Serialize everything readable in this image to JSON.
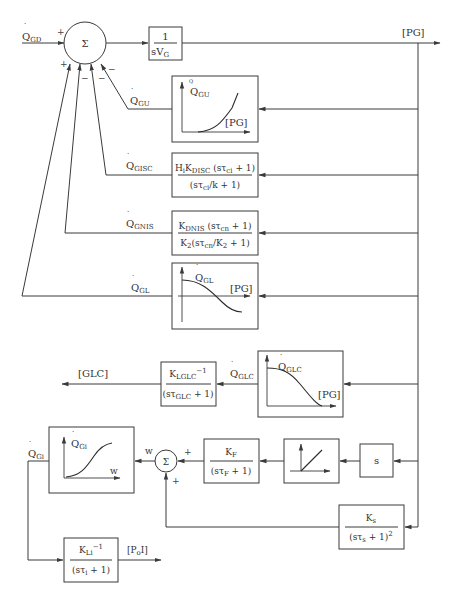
{
  "diagram": {
    "summing_junction_main": {
      "symbol": "Σ",
      "signs": {
        "q_gd": "+",
        "q_gl": "+",
        "q_gnis": "−",
        "q_gisc": "−",
        "q_gu": "−"
      }
    },
    "input": {
      "label_main": "Q",
      "label_sub": "GD",
      "dot": "·"
    },
    "integrator": {
      "numerator": "1",
      "denominator_main": "sV",
      "denominator_sub": "G"
    },
    "output": {
      "label": "[PG]"
    },
    "feedback_blocks": [
      {
        "id": "gu",
        "signal_main": "Q",
        "signal_sub": "GU",
        "type": "curve",
        "curve": "rising",
        "y_label_main": "Q",
        "y_label_sub": "GU",
        "x_label": "[PG]"
      },
      {
        "id": "gisc",
        "signal_main": "Q",
        "signal_sub": "GISC",
        "type": "transfer",
        "numerator": [
          "H",
          "i",
          "K",
          "DISC",
          " (sτ",
          "ci",
          " + 1)"
        ],
        "denominator": [
          "(sτ",
          "ci",
          "/k + 1)"
        ]
      },
      {
        "id": "gnis",
        "signal_main": "Q",
        "signal_sub": "GNIS",
        "type": "transfer",
        "numerator": [
          "K",
          "DNIS",
          " (sτ",
          "cn",
          " + 1)"
        ],
        "denominator": [
          "K",
          "2",
          "(sτ",
          "cn",
          "/K",
          "2",
          " + 1)"
        ]
      },
      {
        "id": "gl",
        "signal_main": "Q",
        "signal_sub": "GL",
        "type": "curve",
        "curve": "falling",
        "y_label_main": "Q",
        "y_label_sub": "GL",
        "x_label": "[PG]"
      }
    ],
    "glc_path": {
      "curve_block": {
        "y_label_main": "Q",
        "y_label_sub": "GLC",
        "x_label": "[PG]"
      },
      "signal_main": "Q",
      "signal_sub": "GLC",
      "transfer": {
        "numerator": [
          "K",
          "LGLC",
          "−1"
        ],
        "denominator": [
          "(sτ",
          "GLC",
          " + 1)"
        ]
      },
      "output_label": "[GLC]"
    },
    "gi_path": {
      "derivative_block": {
        "label": "s"
      },
      "ramp_block": {
        "icon": "ramp-limiter"
      },
      "filter": {
        "numerator": [
          "K",
          "F"
        ],
        "denominator": [
          "(sτ",
          "F",
          " + 1)"
        ]
      },
      "summing_junction": {
        "symbol": "Σ",
        "signs": {
          "filter": "+",
          "sensor": "+"
        }
      },
      "sum_output_label": "w",
      "curve_block": {
        "y_label_main": "Q",
        "y_label_sub": "Gi",
        "x_label": "w"
      },
      "signal_main": "Q",
      "signal_sub": "Gi",
      "sensor": {
        "numerator": [
          "K",
          "s"
        ],
        "denominator": [
          "(sτ",
          "s",
          " + 1)",
          "2"
        ]
      },
      "output_transfer": {
        "numerator": [
          "K",
          "Li",
          "−1"
        ],
        "denominator": [
          "(sτ",
          "i",
          " + 1)"
        ]
      },
      "output_label": [
        "[P",
        "o",
        "I]"
      ]
    }
  }
}
